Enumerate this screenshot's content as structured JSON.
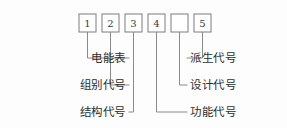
{
  "diagram": {
    "geometry": {
      "width": 287,
      "height": 128,
      "box_width": 17,
      "box_height": 18,
      "box_top": 14,
      "box_pitch": 23,
      "box_first_x": 79,
      "row_y": [
        58,
        85,
        112
      ],
      "left_text_x": 126,
      "right_text_x": 190
    },
    "colors": {
      "background": "#fdfdfd",
      "line": "#8a8a8a",
      "box_stroke": "#7d7d7d",
      "box_fill": "#ffffff",
      "text": "#2e2e2e",
      "box_text": "#3a3a3a"
    },
    "boxes": [
      {
        "id": "box-1",
        "text": "1",
        "x": 79,
        "side": "left",
        "row": 0
      },
      {
        "id": "box-2",
        "text": "2",
        "x": 102,
        "side": "left",
        "row": 1
      },
      {
        "id": "box-3",
        "text": "3",
        "x": 125,
        "side": "left",
        "row": 2
      },
      {
        "id": "box-4",
        "text": "4",
        "x": 148,
        "side": "right",
        "row": 2
      },
      {
        "id": "box-5",
        "text": "",
        "x": 171,
        "side": "right",
        "row": 1
      },
      {
        "id": "box-6",
        "text": "5",
        "x": 194,
        "side": "right",
        "row": 0
      }
    ],
    "labels_left": [
      {
        "id": "label-meter",
        "text": "电能表",
        "row": 0,
        "box": "box-1"
      },
      {
        "id": "label-group",
        "text": "组别代号",
        "row": 1,
        "box": "box-2"
      },
      {
        "id": "label-structure",
        "text": "结构代号",
        "row": 2,
        "box": "box-3"
      }
    ],
    "labels_right": [
      {
        "id": "label-derivative",
        "text": "派生代号",
        "row": 0,
        "box": "box-6"
      },
      {
        "id": "label-design",
        "text": "设计代号",
        "row": 1,
        "box": "box-5"
      },
      {
        "id": "label-function",
        "text": "功能代号",
        "row": 2,
        "box": "box-4"
      }
    ]
  }
}
